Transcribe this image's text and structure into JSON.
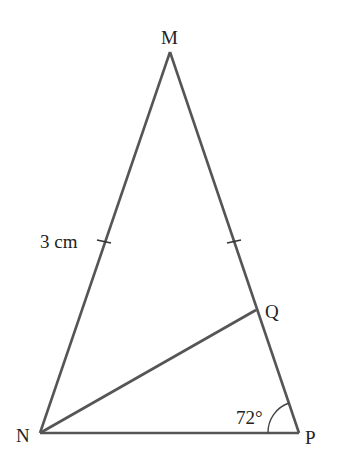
{
  "diagram": {
    "type": "geometry-triangle",
    "vertices": {
      "M": {
        "label": "M",
        "x": 170,
        "y": 52
      },
      "N": {
        "label": "N",
        "x": 40,
        "y": 433
      },
      "P": {
        "label": "P",
        "x": 299,
        "y": 433
      },
      "Q": {
        "label": "Q",
        "x": 256,
        "y": 310
      }
    },
    "segments": [
      "MN",
      "MP",
      "NP",
      "NQ"
    ],
    "annotations": {
      "side_length": "3 cm",
      "angle_P": "72°"
    },
    "equal_side_ticks": [
      "MN",
      "MP"
    ],
    "line_color": "#555555"
  }
}
